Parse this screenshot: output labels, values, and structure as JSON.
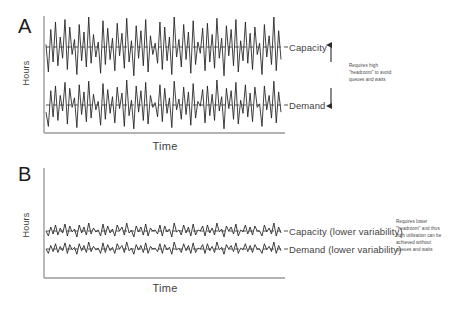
{
  "figure": {
    "background_color": "#ffffff",
    "line_color": "#1f1f1f",
    "axis_color": "#9a9a9a",
    "dash_color": "#3c3c3c",
    "text_color": "#3f3f3f"
  },
  "panels": [
    {
      "letter": "A",
      "ylabel": "Hours",
      "xlabel": "Time",
      "series": [
        {
          "name": "capacity",
          "label": "Capacity",
          "mean_dashed": true
        },
        {
          "name": "demand",
          "label": "Demand",
          "mean_dashed": true
        }
      ],
      "annotation": "Requires high\n\"headroom\" to avoid\nqueues and waits",
      "annotation_has_arrows": true
    },
    {
      "letter": "B",
      "ylabel": "Hours",
      "xlabel": "Time",
      "series": [
        {
          "name": "capacity",
          "label": "Capacity (lower variability)",
          "mean_dashed": true
        },
        {
          "name": "demand",
          "label": "Demand (lower variability)",
          "mean_dashed": true
        }
      ],
      "annotation": "Requires lower\n\"headroom\" and thus\nhigh utilisation can be\nachieved without\nqueues and waits",
      "annotation_has_arrows": false
    }
  ],
  "chart_data": {
    "type": "line",
    "title": "",
    "xlabel": "Time",
    "ylabel": "Hours",
    "grid": false,
    "legend": "right-inline",
    "panels": [
      {
        "letter": "A",
        "axis_ranges": {
          "x": [
            0,
            100
          ],
          "y": [
            0,
            100
          ]
        },
        "series": [
          {
            "name": "Capacity",
            "mean": 72,
            "amplitude": 22,
            "values": [
              74,
              52,
              86,
              60,
              92,
              57,
              80,
              63,
              94,
              54,
              88,
              66,
              78,
              50,
              90,
              61,
              84,
              56,
              96,
              59,
              82,
              64,
              76,
              51,
              93,
              58,
              87,
              62,
              79,
              53,
              91,
              65,
              83,
              55,
              95,
              60,
              77,
              49,
              89,
              63,
              85,
              57,
              94,
              52,
              81,
              66,
              75,
              59,
              92,
              54,
              88,
              61,
              80,
              50,
              96,
              64,
              78,
              56,
              90,
              62,
              84,
              51,
              93,
              58,
              76,
              67,
              87,
              53,
              91,
              60,
              82,
              55,
              95,
              63,
              79,
              49,
              89,
              65,
              86,
              57,
              94,
              52,
              77,
              61,
              92,
              59,
              83,
              54,
              88,
              66,
              75,
              50,
              90,
              64,
              81,
              58,
              96,
              53,
              85,
              62
            ],
            "dashed_mean_line": true
          },
          {
            "name": "Demand",
            "mean": 32,
            "amplitude": 19,
            "values": [
              26,
              14,
              44,
              22,
              48,
              19,
              40,
              27,
              51,
              16,
              46,
              30,
              38,
              13,
              49,
              24,
              43,
              18,
              52,
              21,
              41,
              28,
              35,
              15,
              50,
              20,
              45,
              25,
              39,
              17,
              47,
              29,
              42,
              14,
              53,
              23,
              36,
              12,
              48,
              26,
              44,
              19,
              51,
              16,
              40,
              30,
              34,
              22,
              49,
              18,
              46,
              25,
              38,
              13,
              52,
              28,
              37,
              20,
              47,
              24,
              43,
              15,
              50,
              21,
              35,
              31,
              45,
              17,
              48,
              23,
              41,
              19,
              53,
              27,
              39,
              12,
              46,
              29,
              44,
              20,
              51,
              16,
              36,
              25,
              49,
              22,
              42,
              18,
              47,
              30,
              33,
              14,
              48,
              28,
              40,
              21,
              52,
              17,
              43,
              26
            ],
            "dashed_mean_line": true
          }
        ]
      },
      {
        "letter": "B",
        "axis_ranges": {
          "x": [
            0,
            100
          ],
          "y": [
            0,
            100
          ]
        },
        "series": [
          {
            "name": "Capacity (lower variability)",
            "mean": 62,
            "amplitude": 6,
            "values": [
              62,
              57,
              66,
              59,
              68,
              58,
              65,
              60,
              69,
              57,
              67,
              61,
              64,
              56,
              68,
              60,
              66,
              58,
              70,
              59,
              65,
              61,
              63,
              57,
              69,
              58,
              67,
              60,
              64,
              57,
              68,
              62,
              66,
              58,
              70,
              60,
              63,
              56,
              67,
              61,
              66,
              58,
              69,
              57,
              65,
              62,
              63,
              59,
              68,
              57,
              67,
              61,
              64,
              56,
              70,
              61,
              63,
              58,
              68,
              60,
              66,
              57,
              69,
              58,
              63,
              62,
              67,
              57,
              68,
              60,
              65,
              58,
              70,
              61,
              64,
              56,
              67,
              62,
              66,
              59,
              69,
              57,
              63,
              61,
              68,
              59,
              66,
              58,
              67,
              62,
              62,
              57,
              68,
              61,
              65,
              59,
              70,
              57,
              66,
              60
            ],
            "dashed_mean_line": true
          },
          {
            "name": "Demand (lower variability)",
            "mean": 46,
            "amplitude": 6,
            "values": [
              46,
              41,
              50,
              43,
              52,
              42,
              49,
              44,
              53,
              41,
              51,
              45,
              48,
              40,
              52,
              44,
              50,
              42,
              54,
              43,
              49,
              45,
              47,
              41,
              53,
              42,
              51,
              44,
              48,
              41,
              52,
              46,
              50,
              42,
              54,
              44,
              47,
              40,
              51,
              45,
              50,
              42,
              53,
              41,
              49,
              46,
              47,
              43,
              52,
              41,
              51,
              45,
              48,
              40,
              54,
              45,
              47,
              42,
              52,
              44,
              50,
              41,
              53,
              42,
              47,
              46,
              51,
              41,
              52,
              44,
              49,
              42,
              54,
              45,
              48,
              40,
              51,
              46,
              50,
              43,
              53,
              41,
              47,
              45,
              52,
              43,
              50,
              42,
              51,
              46,
              46,
              41,
              52,
              45,
              49,
              43,
              54,
              41,
              50,
              44
            ],
            "dashed_mean_line": true
          }
        ]
      }
    ]
  }
}
